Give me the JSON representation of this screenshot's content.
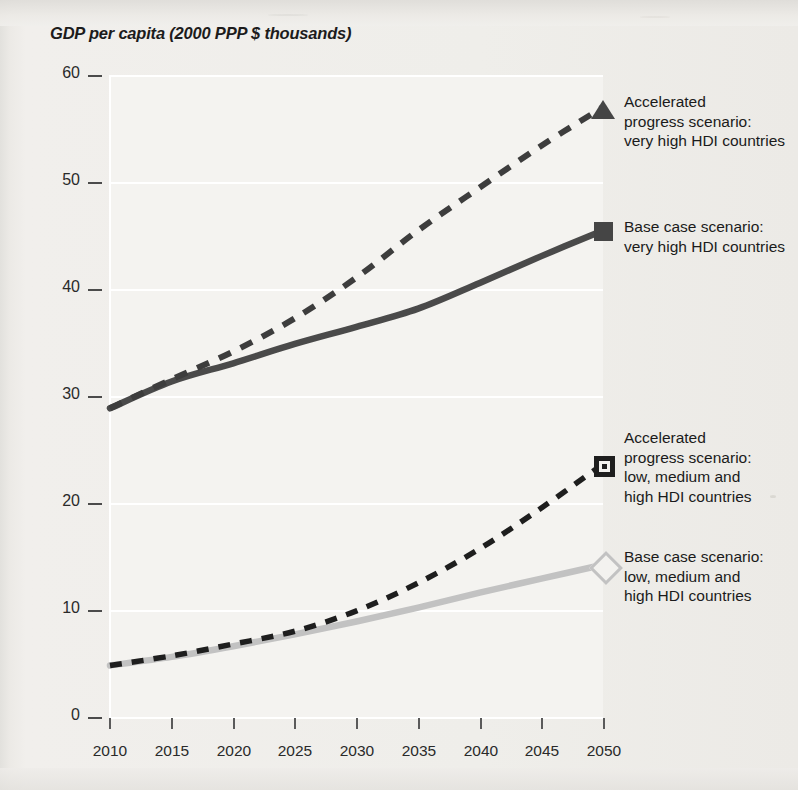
{
  "chart_title": "GDP per capita (2000 PPP $ thousands)",
  "axis": {
    "x_ticks": [
      "2010",
      "2015",
      "2020",
      "2025",
      "2030",
      "2035",
      "2040",
      "2045",
      "2050"
    ],
    "y_ticks": [
      "60",
      "50",
      "40",
      "30",
      "20",
      "10",
      "0"
    ]
  },
  "legend": [
    {
      "marker": "triangle-marker",
      "line1": "Accelerated",
      "line2": "progress scenario:",
      "line3": "very high HDI countries",
      "line4": ""
    },
    {
      "marker": "filled-square-marker",
      "line1": "Base case scenario:",
      "line2": "very high HDI countries",
      "line3": "",
      "line4": ""
    },
    {
      "marker": "framed-square-marker",
      "line1": "Accelerated",
      "line2": "progress scenario:",
      "line3": "low, medium and",
      "line4": "high HDI countries"
    },
    {
      "marker": "open-diamond-marker",
      "line1": "Base case scenario:",
      "line2": "low, medium and",
      "line3": "high HDI countries",
      "line4": ""
    }
  ],
  "colors": {
    "dark_series": "#454545",
    "light_series": "#c2c2c2",
    "background": "#eeedea",
    "plot_background": "#f4f3f0",
    "gridline": "#ffffff",
    "text": "#1c1c1c"
  },
  "chart_data": {
    "type": "line",
    "title": "GDP per capita (2000 PPP $ thousands)",
    "xlabel": "",
    "ylabel": "GDP per capita (2000 PPP $ thousands)",
    "x": [
      2010,
      2015,
      2020,
      2025,
      2030,
      2035,
      2040,
      2045,
      2050
    ],
    "xlim": [
      2010,
      2050
    ],
    "ylim": [
      0,
      60
    ],
    "yticks": [
      0,
      10,
      20,
      30,
      40,
      50,
      60
    ],
    "grid": "horizontal",
    "legend_position": "right",
    "series": [
      {
        "name": "Accelerated progress scenario: very high HDI countries",
        "style": "dashed",
        "color": "#454545",
        "marker": "triangle",
        "values": [
          28.9,
          31.6,
          34.2,
          37.3,
          41.1,
          45.5,
          49.5,
          53.4,
          57.0
        ]
      },
      {
        "name": "Base case scenario: very high HDI countries",
        "style": "solid",
        "color": "#454545",
        "marker": "square",
        "values": [
          28.9,
          31.4,
          33.1,
          34.9,
          36.5,
          38.2,
          40.6,
          43.1,
          45.5
        ]
      },
      {
        "name": "Accelerated progress scenario: low, medium and high HDI countries",
        "style": "dashed",
        "color": "#1e1e1e",
        "marker": "framed-square",
        "values": [
          4.9,
          5.8,
          6.9,
          8.1,
          10.0,
          12.6,
          15.8,
          19.6,
          23.7
        ]
      },
      {
        "name": "Base case scenario: low, medium and high HDI countries",
        "style": "solid",
        "color": "#c2c2c2",
        "marker": "open-diamond",
        "values": [
          4.9,
          5.7,
          6.7,
          7.8,
          9.0,
          10.3,
          11.7,
          13.0,
          14.3
        ]
      }
    ]
  }
}
